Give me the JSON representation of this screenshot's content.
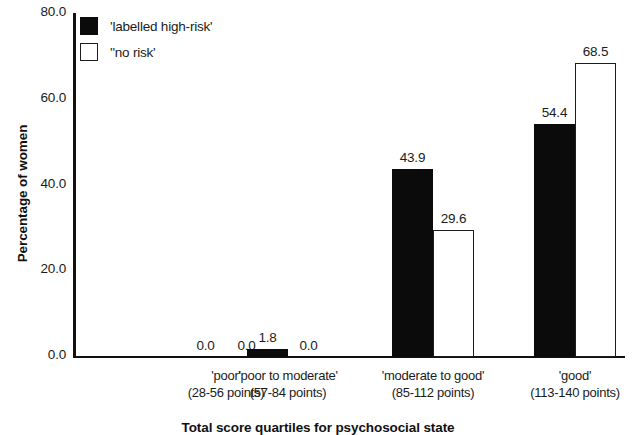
{
  "chart_data": {
    "type": "bar",
    "title": "",
    "xlabel": "Total score quartiles for psychosocial state",
    "ylabel": "Percentage of women",
    "ylim": [
      0,
      80
    ],
    "yticks": [
      "0.0",
      "20.0",
      "40.0",
      "60.0",
      "80.0"
    ],
    "ytick_values": [
      0,
      20,
      40,
      60,
      80
    ],
    "grid": false,
    "legend_position": "top-left",
    "categories": [
      "'poor'",
      "'poor to moderate'",
      "'moderate to good'",
      "'good'"
    ],
    "category_sublabels": [
      "(28-56 points)",
      "(57-84 points)",
      "(85-112 points)",
      "(113-140 points)"
    ],
    "series": [
      {
        "name": "'labelled high-risk'",
        "color": "#0b0b0b",
        "fill": "solid",
        "values": [
          0.0,
          1.8,
          43.9,
          54.4
        ],
        "labels": [
          "0.0",
          "1.8",
          "43.9",
          "54.4"
        ]
      },
      {
        "name": "''no risk'",
        "color": "#ffffff",
        "fill": "outline",
        "values": [
          0.0,
          0.0,
          29.6,
          68.5
        ],
        "labels": [
          "0.0",
          "0.0",
          "29.6",
          "68.5"
        ]
      }
    ]
  },
  "legend": {
    "items": [
      {
        "label": "'labelled high-risk'",
        "swatch": "black"
      },
      {
        "label": "''no risk'",
        "swatch": "white"
      }
    ]
  },
  "axes": {
    "y_title": "Percentage of women",
    "x_title": "Total score quartiles for psychosocial state",
    "y_ticks": [
      "80.0",
      "60.0",
      "40.0",
      "20.0",
      "0.0"
    ]
  }
}
